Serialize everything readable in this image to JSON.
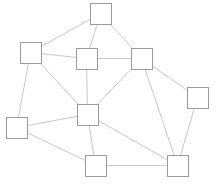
{
  "diagram": {
    "type": "graph",
    "background": "#ffffff",
    "node_fill": "#ffffff",
    "node_stroke": "#9a9a9a",
    "edge_stroke": "#c8c8c8",
    "node_size": 21,
    "nodes": [
      {
        "id": "A",
        "x": 90,
        "y": 3
      },
      {
        "id": "B",
        "x": 20,
        "y": 42
      },
      {
        "id": "C",
        "x": 76,
        "y": 48
      },
      {
        "id": "D",
        "x": 131,
        "y": 48
      },
      {
        "id": "E",
        "x": 187,
        "y": 87
      },
      {
        "id": "F",
        "x": 77,
        "y": 104
      },
      {
        "id": "G",
        "x": 6,
        "y": 117
      },
      {
        "id": "H",
        "x": 85,
        "y": 155
      },
      {
        "id": "I",
        "x": 167,
        "y": 155
      }
    ],
    "edges": [
      [
        "A",
        "B"
      ],
      [
        "A",
        "C"
      ],
      [
        "A",
        "D"
      ],
      [
        "B",
        "C"
      ],
      [
        "B",
        "F"
      ],
      [
        "B",
        "G"
      ],
      [
        "C",
        "D"
      ],
      [
        "C",
        "F"
      ],
      [
        "D",
        "F"
      ],
      [
        "D",
        "E"
      ],
      [
        "D",
        "I"
      ],
      [
        "E",
        "I"
      ],
      [
        "F",
        "G"
      ],
      [
        "F",
        "H"
      ],
      [
        "F",
        "I"
      ],
      [
        "G",
        "H"
      ],
      [
        "H",
        "I"
      ]
    ]
  }
}
